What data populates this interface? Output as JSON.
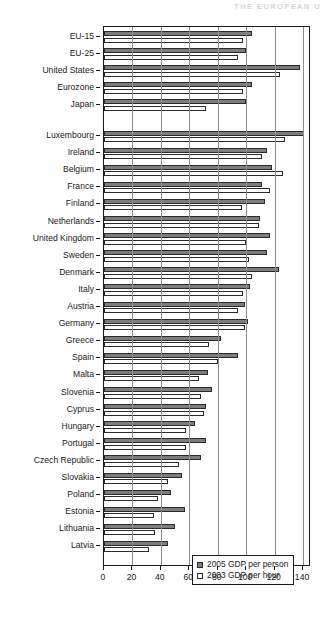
{
  "page": {
    "running_header": "THE EUROPEAN U"
  },
  "legend": {
    "position": "bottom-right",
    "items": [
      {
        "label": "2005 GDP per person",
        "swatch": "filled-gray-square",
        "color": "#7d7d7d"
      },
      {
        "label": "2003 GDP per hour",
        "swatch": "empty-white-square",
        "color": "#ffffff"
      }
    ]
  },
  "chart_data": {
    "type": "bar",
    "orientation": "horizontal",
    "title": "",
    "subtitle": "",
    "xlabel": "",
    "ylabel": "",
    "xlim": [
      0,
      145.6
    ],
    "xticks": [
      0,
      20,
      40,
      60,
      80,
      100,
      120,
      140
    ],
    "xticklabels": [
      "0",
      "20",
      "40",
      "60",
      "80",
      "100",
      "120",
      "140"
    ],
    "grid": true,
    "grid_axis": "x",
    "group_gap_after": [
      "Japan"
    ],
    "categories": [
      "EU-15",
      "EU-25",
      "United States",
      "Eurozone",
      "Japan",
      "Luxembourg",
      "Ireland",
      "Belgium",
      "France",
      "Finland",
      "Netherlands",
      "United Kingdom",
      "Sweden",
      "Denmark",
      "Italy",
      "Austria",
      "Germany",
      "Greece",
      "Spain",
      "Malta",
      "Slovenia",
      "Cyprus",
      "Hungary",
      "Portugal",
      "Czech Republic",
      "Slovakia",
      "Poland",
      "Estonia",
      "Lithuania",
      "Latvia"
    ],
    "series": [
      {
        "name": "2005 GDP per person",
        "color": "#7d7d7d",
        "values": [
          104,
          100,
          138,
          104,
          100,
          141,
          115,
          118,
          111,
          113,
          110,
          117,
          115,
          123,
          103,
          99,
          101,
          82,
          94,
          73,
          76,
          72,
          64,
          72,
          68,
          55,
          47,
          57,
          50,
          45
        ]
      },
      {
        "name": "2003 GDP per hour",
        "color": "#ffffff",
        "values": [
          98,
          94,
          124,
          98,
          72,
          127,
          111,
          126,
          117,
          97,
          109,
          100,
          102,
          104,
          98,
          94,
          99,
          74,
          80,
          67,
          68,
          70,
          58,
          58,
          53,
          45,
          38,
          35,
          36,
          32
        ]
      }
    ]
  }
}
